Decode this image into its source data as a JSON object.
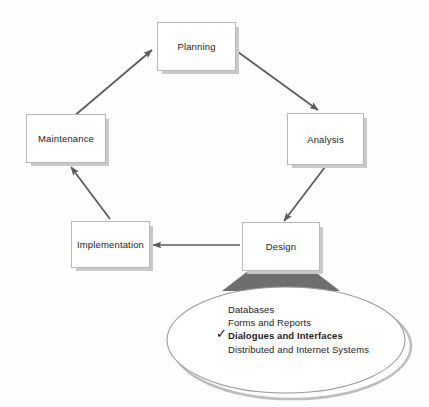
{
  "diagram": {
    "type": "systems-development-life-cycle",
    "colors": {
      "background": "#fdfdfd",
      "box_fill": "#ffffff",
      "box_border": "#b9b9b9",
      "box_shadow": "#c9c9c9",
      "arrow": "#5a5a5a",
      "callout_stem": "#6e6e6e",
      "ellipse_border": "#9a9a9a",
      "ellipse_shadow": "#bdbdbd",
      "text": "#1d1d1d"
    },
    "nodes": [
      {
        "id": "planning",
        "label": "Planning",
        "x": 157,
        "y": 22,
        "w": 79,
        "h": 49
      },
      {
        "id": "analysis",
        "label": "Analysis",
        "x": 287,
        "y": 113,
        "w": 77,
        "h": 52
      },
      {
        "id": "design",
        "label": "Design",
        "x": 242,
        "y": 222,
        "w": 78,
        "h": 49
      },
      {
        "id": "implementation",
        "label": "Implementation",
        "x": 71,
        "y": 221,
        "w": 79,
        "h": 47
      },
      {
        "id": "maintenance",
        "label": "Maintenance",
        "x": 26,
        "y": 114,
        "w": 80,
        "h": 49
      }
    ],
    "edges": [
      {
        "id": "maintenance-to-planning",
        "from": "maintenance",
        "to": "planning"
      },
      {
        "id": "planning-to-analysis",
        "from": "planning",
        "to": "analysis"
      },
      {
        "id": "analysis-to-design",
        "from": "analysis",
        "to": "design"
      },
      {
        "id": "design-to-implementation",
        "from": "design",
        "to": "implementation"
      },
      {
        "id": "implementation-to-maintenance",
        "from": "implementation",
        "to": "maintenance"
      }
    ],
    "callout": {
      "source_node": "design",
      "items": [
        {
          "label": "Databases",
          "selected": false
        },
        {
          "label": "Forms and Reports",
          "selected": false
        },
        {
          "label": "Dialogues and Interfaces",
          "selected": true
        },
        {
          "label": "Distributed and Internet Systems",
          "selected": false
        }
      ],
      "check_glyph": "✓"
    }
  }
}
